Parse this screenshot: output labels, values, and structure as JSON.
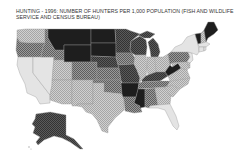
{
  "title": "HUNTING - 1996: NUMBER OF HUNTERS PER 1,000 POPULATION (FISH AND WILDLIFE SERVICE AND CENSUS BUREAU)",
  "map": {
    "type": "choropleth",
    "region": "United States",
    "legend_visible": false,
    "shading_classes": [
      {
        "class": 1,
        "description": "highest",
        "color": "#1e1e1e"
      },
      {
        "class": 2,
        "description": "high",
        "color": "#4a4a4a"
      },
      {
        "class": 3,
        "description": "medium",
        "color": "#7d7d7d"
      },
      {
        "class": 4,
        "description": "low",
        "color": "#b4b4b4"
      },
      {
        "class": 5,
        "description": "lowest",
        "color": "#e4e4e4"
      }
    ],
    "states": {
      "WA": 4,
      "OR": 3,
      "CA": 5,
      "NV": 5,
      "ID": 3,
      "MT": 1,
      "WY": 1,
      "UT": 4,
      "AZ": 4,
      "CO": 3,
      "NM": 4,
      "ND": 1,
      "SD": 1,
      "NE": 2,
      "KS": 3,
      "OK": 3,
      "TX": 4,
      "MN": 2,
      "IA": 3,
      "MO": 2,
      "AR": 1,
      "LA": 3,
      "WI": 2,
      "IL": 4,
      "MI": 2,
      "IN": 4,
      "OH": 4,
      "KY": 2,
      "TN": 3,
      "MS": 1,
      "AL": 3,
      "GA": 4,
      "FL": 5,
      "SC": 4,
      "NC": 4,
      "VA": 4,
      "WV": 1,
      "PA": 3,
      "NY": 5,
      "VT": 1,
      "NH": 4,
      "ME": 1,
      "MA": 5,
      "CT": 5,
      "RI": 5,
      "NJ": 5,
      "DE": 4,
      "MD": 4,
      "AK": 2,
      "HI": 5
    }
  }
}
